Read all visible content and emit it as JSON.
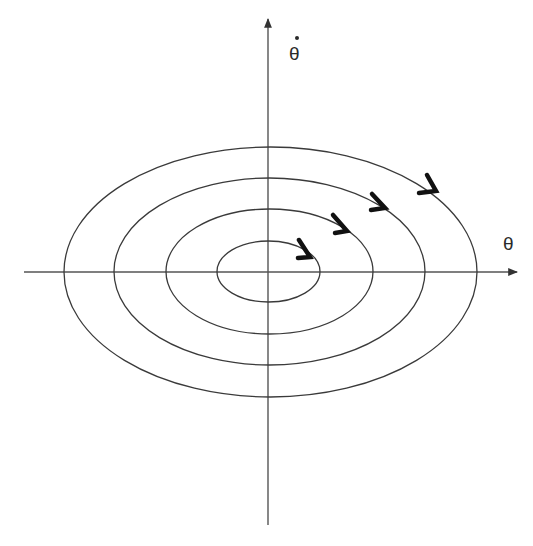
{
  "diagram": {
    "x_axis": {
      "label": "θ",
      "from": [
        24,
        272
      ],
      "to": [
        518,
        272
      ]
    },
    "y_axis": {
      "label": "θ̇",
      "label_base": "θ",
      "label_dot": "•",
      "from": [
        268,
        525
      ],
      "to": [
        268,
        18
      ]
    },
    "center": [
      270,
      272
    ],
    "orbits": [
      {
        "name": "orbit-1",
        "cx": 268.5,
        "cy": 271.5,
        "rx": 51.5,
        "ry": 30.5
      },
      {
        "name": "orbit-2",
        "cx": 269.5,
        "cy": 271.5,
        "rx": 103.5,
        "ry": 62.5
      },
      {
        "name": "orbit-3",
        "cx": 269.5,
        "cy": 271.5,
        "rx": 155.5,
        "ry": 93.5
      },
      {
        "name": "orbit-4",
        "cx": 270.5,
        "cy": 272,
        "rx": 206.5,
        "ry": 125
      }
    ],
    "direction": "clockwise",
    "arrows": [
      {
        "points": "299,240 310,257 298,258"
      },
      {
        "points": "333,215 347,231 335,233"
      },
      {
        "points": "372,194 385,208 371,210"
      },
      {
        "points": "427,175 436,191 419,193"
      }
    ],
    "colors": {
      "line": "#3a3a3a",
      "axis": "#555555",
      "arrow": "#111111",
      "background": "#ffffff"
    }
  }
}
